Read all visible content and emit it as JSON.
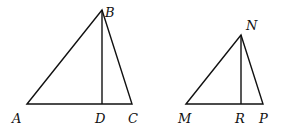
{
  "figure": {
    "triangle1": {
      "points": {
        "A": [
          27,
          104
        ],
        "B": [
          102,
          10
        ],
        "C": [
          132,
          104
        ],
        "D": [
          102,
          104
        ]
      },
      "labels": {
        "A": "A",
        "B": "B",
        "C": "C",
        "D": "D"
      }
    },
    "triangle2": {
      "points": {
        "M": [
          186,
          104
        ],
        "N": [
          241,
          35
        ],
        "P": [
          263,
          104
        ],
        "R": [
          241,
          104
        ]
      },
      "labels": {
        "M": "M",
        "N": "N",
        "P": "P",
        "R": "R"
      }
    }
  }
}
